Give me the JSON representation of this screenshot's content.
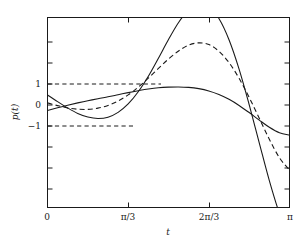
{
  "chart_data": {
    "type": "line",
    "title": "",
    "xlabel": "t",
    "ylabel": "p(t)",
    "xlim": [
      0,
      3.14159265
    ],
    "ylim": [
      -4.0,
      5.1
    ],
    "grid": false,
    "legend": null,
    "xticks": [
      {
        "value": 0,
        "label": "0"
      },
      {
        "value": 1.0471976,
        "label": "π/3"
      },
      {
        "value": 2.0943951,
        "label": "2π/3"
      },
      {
        "value": 3.1415927,
        "label": "π"
      }
    ],
    "yticks": [
      {
        "value": 1,
        "label": "1"
      },
      {
        "value": 0,
        "label": "0"
      },
      {
        "value": -1,
        "label": "−1"
      }
    ],
    "annotations": [
      {
        "name": "upper-bound-guide",
        "kind": "dashed-horizontal",
        "y": 1,
        "x_from": 0,
        "x_to": 1.0471976
      },
      {
        "name": "lower-bound-guide",
        "kind": "dashed-horizontal",
        "y": -1,
        "x_from": 0,
        "x_to": 0.74
      }
    ],
    "series": [
      {
        "name": "p1",
        "style": "solid",
        "x": [
          0.0,
          0.1309,
          0.2618,
          0.3927,
          0.5236,
          0.6545,
          0.7854,
          0.9163,
          1.0472,
          1.1781,
          1.309,
          1.4399,
          1.5708,
          1.7017,
          1.8326,
          1.9635,
          2.0944,
          2.2253,
          2.3562,
          2.4871,
          2.618,
          2.7489,
          2.8798,
          3.0107,
          3.1416
        ],
        "y": [
          -0.26,
          -0.13,
          -0.01,
          0.1,
          0.2,
          0.3,
          0.39,
          0.49,
          0.59,
          0.68,
          0.76,
          0.82,
          0.85,
          0.86,
          0.84,
          0.78,
          0.67,
          0.5,
          0.27,
          -0.02,
          -0.36,
          -0.72,
          -1.06,
          -1.32,
          -1.43
        ]
      },
      {
        "name": "p2",
        "style": "dashed",
        "x": [
          0.0,
          0.1309,
          0.2618,
          0.3927,
          0.5236,
          0.6545,
          0.7854,
          0.9163,
          1.0472,
          1.1781,
          1.309,
          1.4399,
          1.5708,
          1.7017,
          1.8326,
          1.9635,
          2.0944,
          2.2253,
          2.3562,
          2.4871,
          2.618,
          2.7489,
          2.8798,
          3.0107,
          3.1416
        ],
        "y": [
          0.1,
          -0.03,
          -0.14,
          -0.2,
          -0.21,
          -0.15,
          -0.02,
          0.19,
          0.48,
          0.85,
          1.28,
          1.74,
          2.19,
          2.57,
          2.85,
          2.96,
          2.88,
          2.56,
          2.02,
          1.27,
          0.36,
          -0.63,
          -1.63,
          -2.51,
          -3.1
        ]
      },
      {
        "name": "p3",
        "style": "solid",
        "x": [
          0.0,
          0.1309,
          0.2618,
          0.3927,
          0.5236,
          0.6545,
          0.7854,
          0.9163,
          1.0472,
          1.1781,
          1.309,
          1.4399,
          1.5708,
          1.7017,
          1.8326,
          1.9635,
          2.0944,
          2.2253,
          2.3562,
          2.4871,
          2.618,
          2.7489,
          2.8798,
          3.0107,
          3.1416
        ],
        "y": [
          0.48,
          0.16,
          -0.14,
          -0.4,
          -0.57,
          -0.64,
          -0.58,
          -0.35,
          0.05,
          0.63,
          1.37,
          2.23,
          3.12,
          3.93,
          4.53,
          4.81,
          4.69,
          4.12,
          3.11,
          1.71,
          0.02,
          -1.8,
          -3.6,
          -5.16,
          -6.3
        ]
      }
    ]
  }
}
